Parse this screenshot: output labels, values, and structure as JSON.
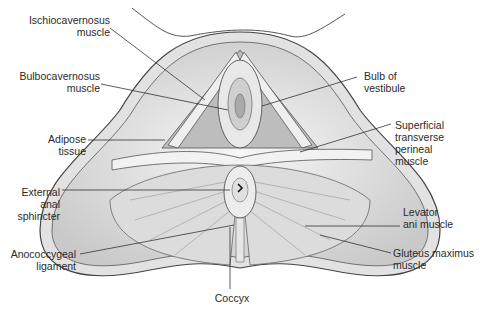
{
  "diagram": {
    "labels_left": [
      {
        "id": "ischiocavernosus",
        "text": "Ischiocavernosus\nmuscle"
      },
      {
        "id": "bulbocavernosus",
        "text": "Bulbocavernosus\nmuscle"
      },
      {
        "id": "adipose",
        "text": "Adipose\ntissue"
      },
      {
        "id": "external_anal_sphincter",
        "text": "External\nanal\nsphincter"
      },
      {
        "id": "anococcygeal",
        "text": "Anococcygeal\nligament"
      }
    ],
    "labels_right": [
      {
        "id": "bulb_vestibule",
        "text": "Bulb of\nvestibule"
      },
      {
        "id": "superficial_transverse",
        "text": "Superficial\ntransverse\nperineal\nmuscle"
      },
      {
        "id": "levator_ani",
        "text": "Levator\nani muscle"
      },
      {
        "id": "gluteus_maximus",
        "text": "Gluteus maximus\nmuscle"
      }
    ],
    "labels_bottom": [
      {
        "id": "coccyx",
        "text": "Coccyx"
      }
    ],
    "colors": {
      "outline": "#444444",
      "fill_light": "#f0f0f0",
      "fill_mid": "#d6d6d6",
      "fill_dark": "#b8b8b8",
      "leader": "#333333"
    }
  }
}
